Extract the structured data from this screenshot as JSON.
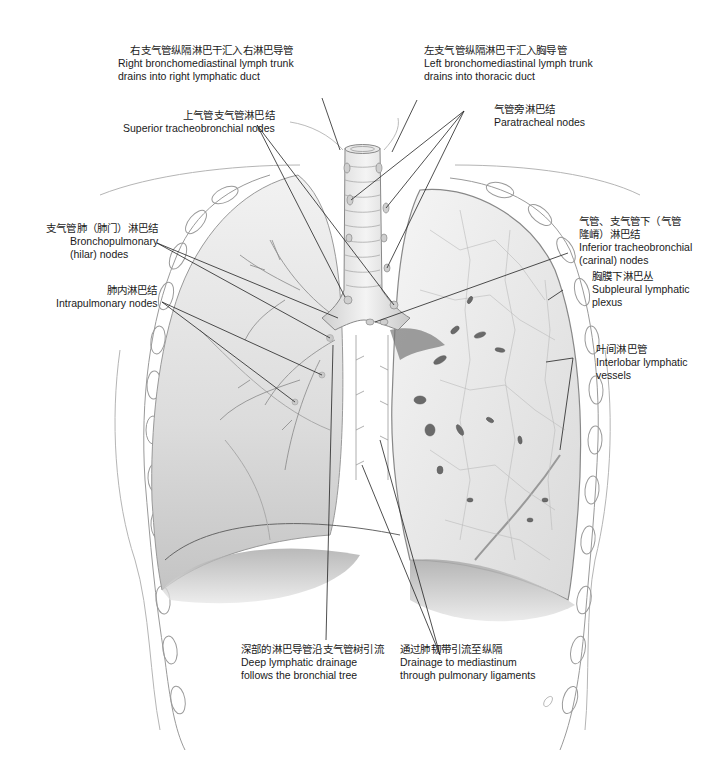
{
  "figure": {
    "colors": {
      "background": "#ffffff",
      "lung_fill": "#e4e4e4",
      "lung_shadow": "#bdbdbd",
      "outline": "#8a8a8a",
      "leader_line": "#222222",
      "text": "#1a1a1a"
    }
  },
  "labels": {
    "right_trunk": {
      "zh": "右支气管纵隔淋巴干汇入右淋巴导管",
      "en1": "Right bronchomediastinal lymph trunk",
      "en2": "drains into right lymphatic duct"
    },
    "left_trunk": {
      "zh": "左支气管纵隔淋巴干汇入胸导管",
      "en1": "Left bronchomediastinal lymph trunk",
      "en2": "drains into thoracic duct"
    },
    "superior_tracheobronchial": {
      "zh": "上气管支气管淋巴结",
      "en1": "Superior tracheobronchial nodes"
    },
    "paratracheal": {
      "zh": "气管旁淋巴结",
      "en1": "Paratracheal nodes"
    },
    "bronchopulmonary": {
      "zh": "支气管肺（肺门）淋巴结",
      "en1": "Bronchopulmonary",
      "en2": "(hilar) nodes"
    },
    "intrapulmonary": {
      "zh": "肺内淋巴结",
      "en1": "Intrapulmonary nodes"
    },
    "inferior_tracheobronchial": {
      "zh1": "气管、支气管下（气管",
      "zh2": "隆嵴）淋巴结",
      "en1": "Inferior tracheobronchial",
      "en2": "(carinal) nodes"
    },
    "subpleural": {
      "zh": "胸膜下淋巴丛",
      "en1": "Subpleural lymphatic",
      "en2": "plexus"
    },
    "interlobar": {
      "zh": "叶间淋巴管",
      "en1": "Interlobar lymphatic",
      "en2": "vessels"
    },
    "deep_drainage": {
      "zh": "深部的淋巴导管沿支气管树引流",
      "en1": "Deep lymphatic drainage",
      "en2": "follows the bronchial tree"
    },
    "ligament_drainage": {
      "zh": "通过肺韧带引流至纵隔",
      "en1": "Drainage to mediastinum",
      "en2": "through pulmonary ligaments"
    }
  }
}
